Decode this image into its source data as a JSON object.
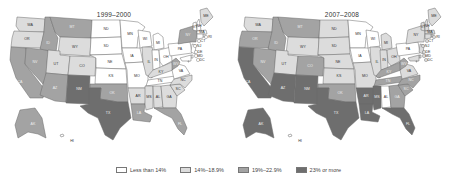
{
  "maps": [
    {
      "title": "1999–2000",
      "states": {
        "WA": 1,
        "OR": 1,
        "CA": 2,
        "NV": 2,
        "ID": 2,
        "MT": 2,
        "WY": 1,
        "UT": 1,
        "CO": 1,
        "AZ": 2,
        "NM": 3,
        "ND": 0,
        "SD": 0,
        "NE": 0,
        "KS": 0,
        "OK": 2,
        "TX": 3,
        "MN": 0,
        "IA": 0,
        "MO": 0,
        "AR": 1,
        "LA": 2,
        "WI": 0,
        "IL": 1,
        "MI": 0,
        "IN": 0,
        "OH": 0,
        "KY": 1,
        "TN": 0,
        "MS": 1,
        "AL": 1,
        "GA": 1,
        "FL": 2,
        "SC": 1,
        "NC": 1,
        "VA": 0,
        "WV": 2,
        "PA": 0,
        "NY": 2,
        "VT": 0,
        "NH": 0,
        "ME": 1,
        "MA": 0,
        "RI": 0,
        "CT": 0,
        "NJ": 0,
        "DE": 0,
        "MD": 0,
        "DC": 0,
        "AK": 2,
        "HI": 0
      }
    },
    {
      "title": "2007–2008",
      "states": {
        "WA": 1,
        "OR": 2,
        "CA": 3,
        "NV": 2,
        "ID": 2,
        "MT": 2,
        "WY": 1,
        "UT": 1,
        "CO": 2,
        "AZ": 3,
        "NM": 3,
        "ND": 1,
        "SD": 1,
        "NE": 1,
        "KS": 1,
        "OK": 2,
        "TX": 3,
        "MN": 0,
        "IA": 0,
        "MO": 1,
        "AR": 3,
        "LA": 3,
        "WI": 0,
        "IL": 1,
        "MI": 1,
        "IN": 1,
        "OH": 1,
        "KY": 2,
        "TN": 2,
        "MS": 3,
        "AL": 0,
        "GA": 2,
        "FL": 3,
        "SC": 2,
        "NC": 2,
        "VA": 1,
        "WV": 2,
        "PA": 0,
        "NY": 1,
        "VT": 1,
        "NH": 1,
        "ME": 1,
        "MA": 1,
        "RI": 1,
        "CT": 1,
        "NJ": 1,
        "DE": 1,
        "MD": 1,
        "DC": 1,
        "AK": 3,
        "HI": 0
      }
    }
  ],
  "legend": [
    {
      "label": "Less than 14%",
      "color": "#ffffff"
    },
    {
      "label": "14%–18.9%",
      "color": "#dcdcdc"
    },
    {
      "label": "19%–22.9%",
      "color": "#a3a3a3"
    },
    {
      "label": "23% or more",
      "color": "#6e6e6e"
    }
  ]
}
